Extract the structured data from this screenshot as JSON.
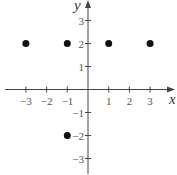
{
  "chart_data": {
    "type": "scatter",
    "title": "",
    "xlabel": "x",
    "ylabel": "y",
    "xlim": [
      -3.8,
      4
    ],
    "ylim": [
      -3.7,
      3.9
    ],
    "xticks": [
      -3,
      -2,
      -1,
      1,
      2,
      3
    ],
    "yticks": [
      3,
      2,
      1,
      -1,
      -2,
      -3
    ],
    "xtick_labels": [
      "−3",
      "−2",
      "−1",
      "1",
      "2",
      "3"
    ],
    "ytick_labels": [
      "3",
      "2",
      "1",
      "−1",
      "−2",
      "−3"
    ],
    "grid": false,
    "legend": null,
    "points": [
      {
        "x": -3,
        "y": 2
      },
      {
        "x": -1,
        "y": 2
      },
      {
        "x": 1,
        "y": 2
      },
      {
        "x": 3,
        "y": 2
      },
      {
        "x": -1,
        "y": -2
      }
    ]
  },
  "colors": {
    "axis": "#444444",
    "point": "#111111",
    "label": "#555555"
  }
}
